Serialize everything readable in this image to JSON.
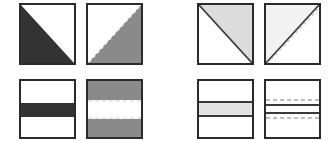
{
  "figure": {
    "title": "",
    "background_color": "#ffffff",
    "width": 336,
    "height": 141,
    "groups": [
      {
        "name": "high-contrast-group",
        "label": "",
        "contrast": "high",
        "position": {
          "x": 0,
          "y": 0,
          "width": 160,
          "height": 141
        }
      },
      {
        "name": "low-contrast-group",
        "label": "",
        "contrast": "low",
        "position": {
          "x": 176,
          "y": 0,
          "width": 160,
          "height": 141
        }
      }
    ]
  },
  "colors": {
    "border": "#2b2b2b",
    "fill_dark": "#333333",
    "fill_medium": "#8a8a8a",
    "fill_light": "#d8d8d8",
    "fill_very_light": "#efefef",
    "fill_white": "#ffffff",
    "dash_light": "#e8e8e8",
    "dash_dark": "#b9b9b9",
    "line_solid": "#3a3a3a"
  },
  "panels": [
    {
      "id": "panel-1",
      "name": "diagonal-dark-no-dash",
      "row": 0,
      "column": 0,
      "group": "high-contrast-group",
      "pattern": "diagonal",
      "contrast": "high",
      "dashed_overlay": false,
      "fill_color": "#333333",
      "background_color": "#ffffff",
      "border_color": "#2b2b2b",
      "diagonal": {
        "from": "top-left",
        "to": "bottom-right",
        "filled_side": "lower-left",
        "edge_style": "hard"
      },
      "position": {
        "x": 19,
        "y": 3,
        "width": 57,
        "height": 62
      }
    },
    {
      "id": "panel-2",
      "name": "diagonal-dark-dashed",
      "row": 0,
      "column": 1,
      "group": "high-contrast-group",
      "pattern": "diagonal",
      "contrast": "high",
      "dashed_overlay": true,
      "fill_color": "#8a8a8a",
      "background_color": "#ffffff",
      "border_color": "#2b2b2b",
      "diagonal": {
        "from": "bottom-left",
        "to": "top-right",
        "filled_side": "lower-right",
        "edge_style": "hard"
      },
      "dash_color": "#f2f2f2",
      "dash_pattern": "3 3",
      "position": {
        "x": 86,
        "y": 3,
        "width": 57,
        "height": 62
      }
    },
    {
      "id": "panel-3",
      "name": "bands-dark-no-dash",
      "row": 1,
      "column": 0,
      "group": "high-contrast-group",
      "pattern": "horizontal-bands",
      "contrast": "high",
      "dashed_overlay": false,
      "band_fill": "#333333",
      "background_color": "#ffffff",
      "border_color": "#2b2b2b",
      "bands": [
        {
          "name": "top-band",
          "fill": "#ffffff",
          "start_pct": 0,
          "end_pct": 40
        },
        {
          "name": "middle-band",
          "fill": "#333333",
          "start_pct": 40,
          "end_pct": 64
        },
        {
          "name": "bottom-band",
          "fill": "#ffffff",
          "start_pct": 64,
          "end_pct": 100
        }
      ],
      "position": {
        "x": 19,
        "y": 79,
        "width": 57,
        "height": 60
      }
    },
    {
      "id": "panel-4",
      "name": "bands-dark-dashed",
      "row": 1,
      "column": 1,
      "group": "high-contrast-group",
      "pattern": "horizontal-bands",
      "contrast": "high",
      "dashed_overlay": true,
      "band_fill": "#8a8a8a",
      "background_color": "#ffffff",
      "border_color": "#2b2b2b",
      "bands": [
        {
          "name": "top-band",
          "fill": "#8a8a8a",
          "start_pct": 0,
          "end_pct": 36
        },
        {
          "name": "middle-band",
          "fill": "#ffffff",
          "start_pct": 36,
          "end_pct": 68
        },
        {
          "name": "bottom-band",
          "fill": "#8a8a8a",
          "start_pct": 68,
          "end_pct": 100
        }
      ],
      "dash_color": "#efefef",
      "dash_pattern": "4 3",
      "dash_positions_pct": [
        38,
        66
      ],
      "position": {
        "x": 86,
        "y": 79,
        "width": 57,
        "height": 60
      }
    },
    {
      "id": "panel-5",
      "name": "diagonal-light-no-dash",
      "row": 0,
      "column": 0,
      "group": "low-contrast-group",
      "pattern": "diagonal",
      "contrast": "low",
      "dashed_overlay": false,
      "fill_color": "#dcdcdc",
      "background_color": "#ffffff",
      "border_color": "#2b2b2b",
      "diagonal": {
        "from": "top-left",
        "to": "bottom-right",
        "filled_side": "upper-right",
        "edge_style": "line"
      },
      "line_color": "#3a3a3a",
      "position": {
        "x": 197,
        "y": 3,
        "width": 57,
        "height": 62
      }
    },
    {
      "id": "panel-6",
      "name": "diagonal-light-dashed",
      "row": 0,
      "column": 1,
      "group": "low-contrast-group",
      "pattern": "diagonal",
      "contrast": "low",
      "dashed_overlay": true,
      "fill_color": "#f2f2f2",
      "background_color": "#ffffff",
      "border_color": "#2b2b2b",
      "diagonal": {
        "from": "bottom-left",
        "to": "top-right",
        "filled_side": "upper-left",
        "edge_style": "line"
      },
      "line_color": "#3a3a3a",
      "dash_color": "#c9c9c9",
      "dash_pattern": "3 3",
      "position": {
        "x": 264,
        "y": 3,
        "width": 57,
        "height": 62
      }
    },
    {
      "id": "panel-7",
      "name": "bands-light-no-dash",
      "row": 1,
      "column": 0,
      "group": "low-contrast-group",
      "pattern": "horizontal-bands",
      "contrast": "low",
      "dashed_overlay": false,
      "band_fill": "#e2e2e2",
      "background_color": "#ffffff",
      "border_color": "#2b2b2b",
      "bands": [
        {
          "name": "top-band",
          "fill": "#ffffff",
          "start_pct": 0,
          "end_pct": 38
        },
        {
          "name": "middle-band",
          "fill": "#e2e2e2",
          "start_pct": 38,
          "end_pct": 62
        },
        {
          "name": "bottom-band",
          "fill": "#ffffff",
          "start_pct": 62,
          "end_pct": 100
        }
      ],
      "line_color": "#3a3a3a",
      "position": {
        "x": 197,
        "y": 79,
        "width": 57,
        "height": 60
      }
    },
    {
      "id": "panel-8",
      "name": "bands-light-dashed",
      "row": 1,
      "column": 1,
      "group": "low-contrast-group",
      "pattern": "horizontal-bands",
      "contrast": "low",
      "dashed_overlay": true,
      "band_fill": "#ffffff",
      "background_color": "#ffffff",
      "border_color": "#2b2b2b",
      "bands": [
        {
          "name": "top-band",
          "fill": "#ffffff",
          "start_pct": 0,
          "end_pct": 42
        },
        {
          "name": "middle-band",
          "fill": "#ffffff",
          "start_pct": 42,
          "end_pct": 58
        },
        {
          "name": "bottom-band",
          "fill": "#ffffff",
          "start_pct": 58,
          "end_pct": 100
        }
      ],
      "line_color": "#3a3a3a",
      "solid_positions_pct": [
        42,
        58
      ],
      "dash_color": "#bdbdbd",
      "dash_pattern": "4 3",
      "dash_positions_pct": [
        36,
        64
      ],
      "position": {
        "x": 264,
        "y": 79,
        "width": 57,
        "height": 60
      }
    }
  ]
}
